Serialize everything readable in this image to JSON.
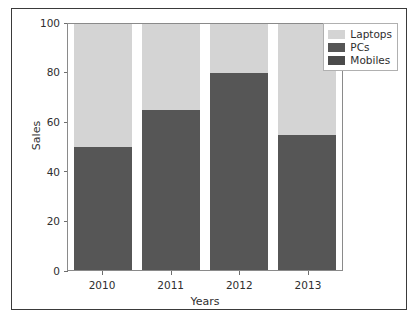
{
  "chart_data": {
    "type": "bar",
    "subtype": "stacked-bar",
    "title": "",
    "xlabel": "Years",
    "ylabel": "Sales",
    "categories": [
      "2010",
      "2011",
      "2012",
      "2013"
    ],
    "ylim": [
      0,
      100
    ],
    "yticks": [
      0,
      20,
      40,
      60,
      80,
      100
    ],
    "ytick_labels": [
      "0",
      "20",
      "40",
      "60",
      "80",
      "100"
    ],
    "grid": false,
    "legend_position": "upper-right-outside",
    "series": [
      {
        "name": "Mobiles",
        "color": "#565656",
        "values": [
          50,
          65,
          80,
          55
        ]
      },
      {
        "name": "PCs",
        "color": "#4a4a4a",
        "values": [
          0,
          0,
          0,
          0
        ]
      },
      {
        "name": "Laptops",
        "color": "#d4d4d4",
        "values": [
          50,
          35,
          20,
          45
        ]
      }
    ],
    "stack_tops": [
      100,
      100,
      100,
      100
    ]
  },
  "legend": {
    "entries": [
      {
        "label": "Laptops",
        "color": "#d4d4d4"
      },
      {
        "label": "PCs",
        "color": "#565656"
      },
      {
        "label": "Mobiles",
        "color": "#4a4a4a"
      }
    ]
  },
  "axes": {
    "y_title": "Sales",
    "x_title": "Years",
    "y_tick_labels": [
      "100",
      "80",
      "60",
      "40",
      "20",
      "0"
    ],
    "x_tick_labels": [
      "2010",
      "2011",
      "2012",
      "2013"
    ]
  },
  "style": {
    "plot_border": "#8a8a8a",
    "frame_border": "#3a3a3a",
    "background": "#ffffff",
    "text": "#2e2e2e"
  }
}
